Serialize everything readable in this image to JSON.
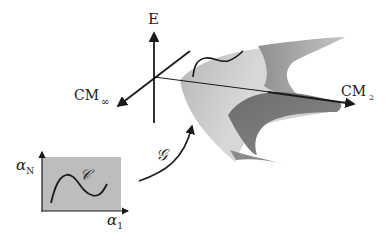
{
  "diagram": {
    "axes3d": {
      "vertical_label": "E",
      "left_axis_label": "CM",
      "left_axis_subscript": "∞",
      "right_axis_label": "CM",
      "right_axis_subscript": "2"
    },
    "parameter_space": {
      "y_label": "α",
      "y_subscript": "N",
      "x_label": "α",
      "x_subscript": "1",
      "curve_label": "𝒞"
    },
    "mapping": {
      "label": "𝒢"
    },
    "colors": {
      "surface_light": "#c9c9c9",
      "surface_mid": "#a8a8a8",
      "surface_dark": "#7a7a7a",
      "param_box": "#bdbdbd",
      "ink": "#1a1a1a"
    }
  }
}
